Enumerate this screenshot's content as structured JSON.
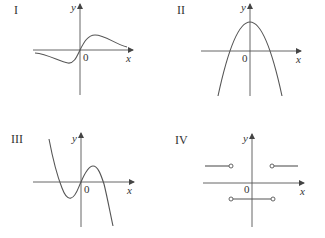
{
  "graphs": [
    {
      "id": "I",
      "label": "I",
      "y_axis_label": "y",
      "x_axis_label": "x",
      "origin_label": "0",
      "description": "Odd function: negative dip left of origin, passes through origin, positive hump right, decays toward 0 both sides"
    },
    {
      "id": "II",
      "label": "II",
      "y_axis_label": "y",
      "x_axis_label": "x",
      "origin_label": "0",
      "description": "Downward-opening parabola with vertex on positive y-axis, two x-intercepts"
    },
    {
      "id": "III",
      "label": "III",
      "y_axis_label": "y",
      "x_axis_label": "x",
      "origin_label": "0",
      "description": "Cubic with negative leading coefficient: local min left of origin, passes through origin, local max right"
    },
    {
      "id": "IV",
      "label": "IV",
      "y_axis_label": "y",
      "x_axis_label": "x",
      "origin_label": "0",
      "description": "Step function: positive constant for x<-a and x>a, negative constant for -a<x<a, open circles at endpoints"
    }
  ],
  "colors": {
    "stroke": "#555555",
    "text": "#333333",
    "background": "#ffffff"
  }
}
